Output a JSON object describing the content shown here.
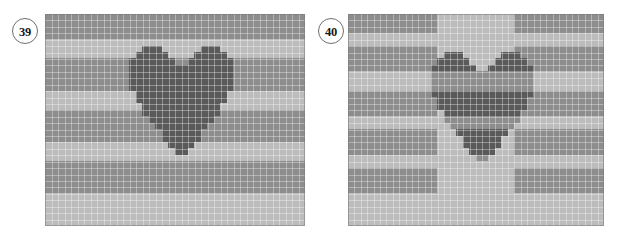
{
  "figure": {
    "background_color": "#ffffff",
    "width": 617,
    "height": 238
  },
  "palette": {
    "stripe_dark": "#8d8d8d",
    "stripe_light": "#bcbcbc",
    "motif_dark": "#5a5a5a",
    "motif_mid": "#8d8d8d",
    "grid_line": "#9e9e9e",
    "grid_line_light": "#cbcbcb",
    "badge_border": "#6f6f6f",
    "badge_text": "#171717",
    "badge_fill": "#ffffff"
  },
  "panels": [
    {
      "id": "panel-39",
      "badge_label": "39",
      "badge_name": "panel-number-badge-39",
      "cols": 40,
      "rows": 33,
      "cell": 6.5,
      "description": "Solid dark heart motif over horizontally striped grid background",
      "stripes": [
        {
          "start_row": 0,
          "end_row": 4,
          "tone": "dark"
        },
        {
          "start_row": 4,
          "end_row": 7,
          "tone": "light"
        },
        {
          "start_row": 7,
          "end_row": 12,
          "tone": "dark"
        },
        {
          "start_row": 12,
          "end_row": 15,
          "tone": "light"
        },
        {
          "start_row": 15,
          "end_row": 20,
          "tone": "dark"
        },
        {
          "start_row": 20,
          "end_row": 23,
          "tone": "light"
        },
        {
          "start_row": 23,
          "end_row": 28,
          "tone": "dark"
        },
        {
          "start_row": 28,
          "end_row": 33,
          "tone": "light"
        }
      ],
      "motif": {
        "fill": "solid",
        "offset_col": 13,
        "offset_row": 5,
        "rows": [
          "0011100000011100",
          "0111110000111110",
          "1111111001111111",
          "1111111111111111",
          "1111111111111111",
          "1111111111111111",
          "1111111111111111",
          "0111111111111110",
          "0111111111111110",
          "0011111111111100",
          "0011111111111100",
          "0001111111111000",
          "0000111111110000",
          "0000011111100000",
          "0000011111100000",
          "0000001111000000",
          "0000000110000000"
        ]
      }
    },
    {
      "id": "panel-40",
      "badge_label": "40",
      "badge_name": "panel-number-badge-40",
      "cols": 40,
      "rows": 33,
      "cell": 6.4,
      "description": "Heart motif rendered as inverted (XOR) stripes against striped grid background",
      "stripes": [
        {
          "start_row": 0,
          "end_row": 3,
          "tone": "dark"
        },
        {
          "start_row": 3,
          "end_row": 5,
          "tone": "light"
        },
        {
          "start_row": 5,
          "end_row": 9,
          "tone": "dark"
        },
        {
          "start_row": 9,
          "end_row": 12,
          "tone": "light"
        },
        {
          "start_row": 12,
          "end_row": 16,
          "tone": "dark"
        },
        {
          "start_row": 16,
          "end_row": 18,
          "tone": "light"
        },
        {
          "start_row": 18,
          "end_row": 22,
          "tone": "dark"
        },
        {
          "start_row": 22,
          "end_row": 24,
          "tone": "light"
        },
        {
          "start_row": 24,
          "end_row": 28,
          "tone": "dark"
        },
        {
          "start_row": 28,
          "end_row": 33,
          "tone": "light"
        }
      ],
      "center_band": {
        "start_col": 14,
        "end_col": 26
      },
      "motif": {
        "fill": "inverted",
        "offset_col": 13,
        "offset_row": 6,
        "rows": [
          "0011100000011100",
          "0111110000111110",
          "1111111001111111",
          "1111111111111111",
          "1111111111111111",
          "1111111111111111",
          "1111111111111111",
          "0111111111111110",
          "0111111111111110",
          "0011111111111100",
          "0011111111111100",
          "0001111111111000",
          "0000111111110000",
          "0000011111100000",
          "0000011111100000",
          "0000001111000000",
          "0000000110000000"
        ]
      }
    }
  ]
}
